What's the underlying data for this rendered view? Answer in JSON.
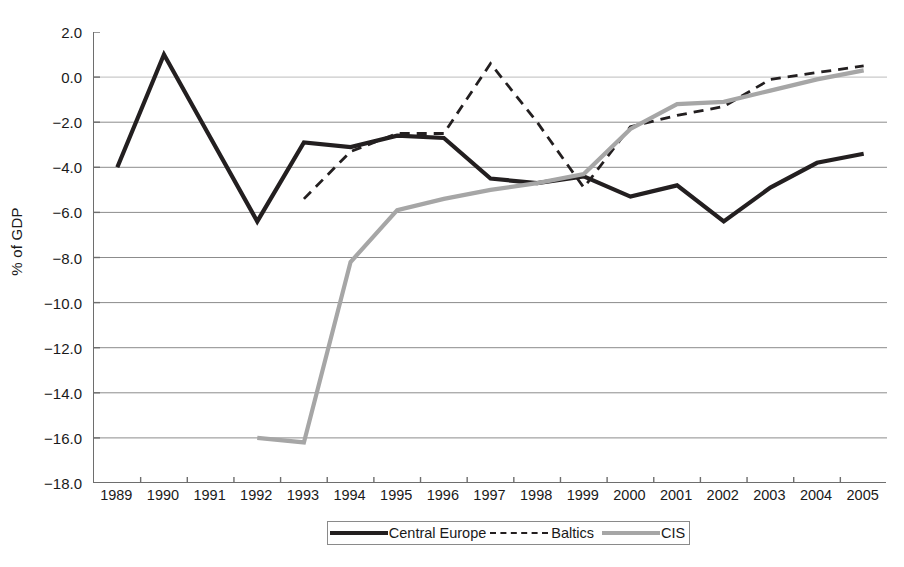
{
  "chart_data": {
    "type": "line",
    "title": "",
    "xlabel": "",
    "ylabel": "% of GDP",
    "categories": [
      "1989",
      "1990",
      "1991",
      "1992",
      "1993",
      "1994",
      "1995",
      "1996",
      "1997",
      "1998",
      "1999",
      "2000",
      "2001",
      "2002",
      "2003",
      "2004",
      "2005"
    ],
    "ylim": [
      -18.0,
      2.0
    ],
    "ytick_labels": [
      "2.0",
      "0.0",
      "-2.0",
      "-4.0",
      "-6.0",
      "-8.0",
      "-10.0",
      "-12.0",
      "-14.0",
      "-16.0",
      "-18.0"
    ],
    "ytick_values": [
      2.0,
      0.0,
      -2.0,
      -4.0,
      -6.0,
      -8.0,
      -10.0,
      -12.0,
      -14.0,
      -16.0,
      -18.0
    ],
    "grid": true,
    "grid_axis": "y",
    "legend_position": "bottom",
    "series": [
      {
        "name": "Central Europe",
        "style": "solid",
        "color": "#231f20",
        "width": 4.2,
        "values": [
          -4.0,
          1.0,
          -2.7,
          -6.4,
          -2.9,
          -3.1,
          -2.6,
          -2.7,
          -4.5,
          -4.7,
          -4.4,
          -5.3,
          -4.8,
          -6.4,
          -4.9,
          -3.8,
          -3.4
        ]
      },
      {
        "name": "Baltics",
        "style": "dashed",
        "color": "#231f20",
        "width": 2.8,
        "values": [
          null,
          null,
          null,
          null,
          -5.4,
          -3.3,
          -2.5,
          -2.5,
          0.6,
          -2.0,
          -4.9,
          -2.2,
          -1.7,
          -1.3,
          -0.1,
          0.2,
          0.5
        ]
      },
      {
        "name": "CIS",
        "style": "solid",
        "color": "#a6a6a6",
        "width": 4.2,
        "values": [
          null,
          null,
          null,
          -16.0,
          -16.2,
          -8.2,
          -5.9,
          -5.4,
          -5.0,
          -4.7,
          -4.3,
          -2.3,
          -1.2,
          -1.1,
          -0.6,
          -0.1,
          0.3
        ]
      }
    ]
  },
  "legend": {
    "items": [
      {
        "label": "Central Europe",
        "swatch": "solid-black-line-swatch"
      },
      {
        "label": "Baltics",
        "swatch": "dashed-black-line-swatch"
      },
      {
        "label": "CIS",
        "swatch": "solid-gray-line-swatch"
      }
    ]
  }
}
